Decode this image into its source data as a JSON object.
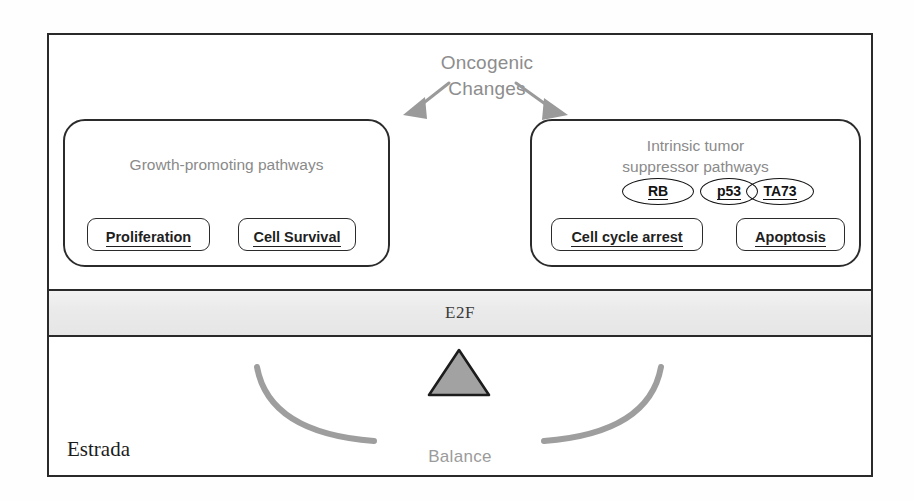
{
  "figure": {
    "oncogenic": {
      "line1": "Oncogenic",
      "line2": "Changes",
      "arrow_left_name": "arrow-down-left-icon",
      "arrow_right_name": "arrow-down-right-icon",
      "color": "#8d8d8d"
    },
    "left_box": {
      "title": "Growth-promoting pathways",
      "sub_boxes": [
        {
          "label": "Proliferation"
        },
        {
          "label": "Cell Survival"
        }
      ]
    },
    "right_box": {
      "title_line1": "Intrinsic tumor",
      "title_line2": "suppressor pathways",
      "genes": [
        {
          "label": "RB"
        },
        {
          "label": "p53"
        },
        {
          "label": "TA73"
        }
      ],
      "sub_boxes": [
        {
          "label": "Cell cycle arrest"
        },
        {
          "label": "Apoptosis"
        }
      ]
    },
    "e2f_band": {
      "label": "E2F",
      "fill": "#ebebeb"
    },
    "balance": {
      "label": "Balance",
      "fulcrum_name": "triangle-fulcrum-icon",
      "fulcrum_fill": "#a2a2a2",
      "arc_color": "#9e9e9e"
    },
    "credit": "Estrada",
    "frame_color": "#2a2a2a"
  }
}
